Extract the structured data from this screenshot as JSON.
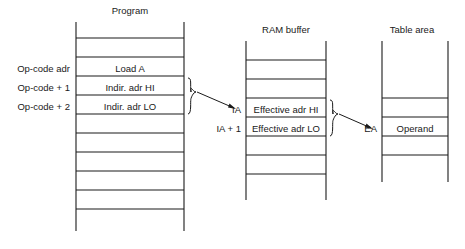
{
  "diagram": {
    "blocks": [
      {
        "id": "program",
        "title": "Program",
        "rows": [
          {
            "label": "",
            "text": ""
          },
          {
            "label": "",
            "text": ""
          },
          {
            "label": "Op-code adr",
            "text": "Load A"
          },
          {
            "label": "Op-code + 1",
            "text": "Indir. adr HI"
          },
          {
            "label": "Op-code + 2",
            "text": "Indir. adr LO"
          },
          {
            "label": "",
            "text": ""
          },
          {
            "label": "",
            "text": ""
          },
          {
            "label": "",
            "text": ""
          },
          {
            "label": "",
            "text": ""
          },
          {
            "label": "",
            "text": ""
          }
        ]
      },
      {
        "id": "ram-buffer",
        "title": "RAM buffer",
        "rows": [
          {
            "label": "",
            "text": ""
          },
          {
            "label": "",
            "text": ""
          },
          {
            "label": "IA",
            "text": "Effective adr HI"
          },
          {
            "label": "IA + 1",
            "text": "Effective adr LO"
          },
          {
            "label": "",
            "text": ""
          },
          {
            "label": "",
            "text": ""
          }
        ]
      },
      {
        "id": "table-area",
        "title": "Table area",
        "rows": [
          {
            "label": "",
            "text": ""
          },
          {
            "label": "",
            "text": ""
          },
          {
            "label": "",
            "text": ""
          },
          {
            "label": "EA",
            "text": "Operand"
          },
          {
            "label": "",
            "text": ""
          }
        ]
      }
    ],
    "pointers": {
      "ia": "IA",
      "ia_plus_1": "IA + 1",
      "ea": "EA"
    },
    "colors": {
      "ink": "#1a1a1a",
      "background": "#ffffff"
    }
  }
}
